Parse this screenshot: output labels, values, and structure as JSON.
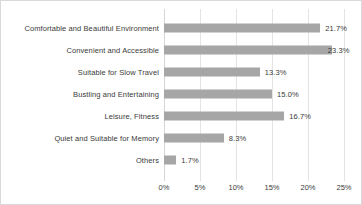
{
  "chart_data": {
    "type": "bar",
    "orientation": "horizontal",
    "title": "",
    "xlabel": "",
    "ylabel": "",
    "xlim": [
      0,
      25
    ],
    "grid": true,
    "legend": false,
    "bar_color": "#a6a6a6",
    "gridline_color": "#e4e4e4",
    "categories": [
      "Comfortable and Beautiful Environment",
      "Convenient and Accessible",
      "Suitable for Slow Travel",
      "Bustling and Entertaining",
      "Leisure, Fitness",
      "Quiet and Suitable for Memory",
      "Others"
    ],
    "values": [
      21.7,
      23.3,
      13.3,
      15.0,
      16.7,
      8.3,
      1.7
    ],
    "value_labels": [
      "21.7%",
      "23.3%",
      "13.3%",
      "15.0%",
      "16.7%",
      "8.3%",
      "1.7%"
    ],
    "xticks": [
      0,
      5,
      10,
      15,
      20,
      25
    ],
    "xtick_labels": [
      "0%",
      "5%",
      "10%",
      "15%",
      "20%",
      "25%"
    ]
  }
}
